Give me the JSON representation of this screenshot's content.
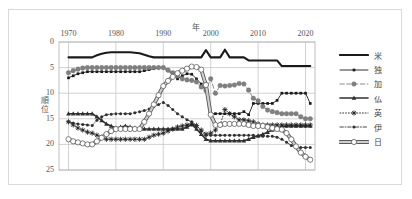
{
  "chart_data": {
    "type": "line",
    "title": "",
    "xlabel": "年",
    "ylabel": "順位",
    "xlim": [
      1968,
      2022
    ],
    "ylim": [
      0,
      25
    ],
    "y_inverted": true,
    "grid": true,
    "legend_position": "right",
    "xticks": [
      "1970",
      "1980",
      "1990",
      "2000",
      "2010",
      "2020"
    ],
    "xtick_values": [
      1970,
      1980,
      1990,
      2000,
      2010,
      2020
    ],
    "yticks": [
      "0",
      "5",
      "10",
      "15",
      "20",
      "25"
    ],
    "ytick_values": [
      0,
      5,
      10,
      15,
      20,
      25
    ],
    "x": [
      1970,
      1971,
      1972,
      1973,
      1974,
      1975,
      1976,
      1977,
      1978,
      1979,
      1980,
      1981,
      1982,
      1983,
      1984,
      1985,
      1986,
      1987,
      1988,
      1989,
      1990,
      1991,
      1992,
      1993,
      1994,
      1995,
      1996,
      1997,
      1998,
      1999,
      2000,
      2001,
      2002,
      2003,
      2004,
      2005,
      2006,
      2007,
      2008,
      2009,
      2010,
      2011,
      2012,
      2013,
      2014,
      2015,
      2016,
      2017,
      2018,
      2019,
      2020,
      2021
    ],
    "series": [
      {
        "name": "米",
        "marker": "none",
        "line": "solid",
        "width": 2.1,
        "color": "#1a1a1a",
        "values": [
          3,
          3,
          3,
          3,
          3,
          3,
          2.6,
          2.3,
          2.1,
          2,
          2,
          2,
          2,
          2,
          2.1,
          2.2,
          2.5,
          2.8,
          3,
          3,
          3,
          3,
          3,
          3,
          3,
          3,
          3,
          3,
          3,
          1.6,
          3,
          3,
          3,
          1.5,
          3,
          3,
          3,
          3,
          3.6,
          3.6,
          3.6,
          3.6,
          3.6,
          3.6,
          3.6,
          4.7,
          4.7,
          4.7,
          4.7,
          4.7,
          4.7,
          4.7
        ]
      },
      {
        "name": "独",
        "marker": "square-small",
        "line": "solid",
        "width": 0.9,
        "color": "#1a1a1a",
        "values": [
          7,
          6.6,
          6.2,
          6,
          5.8,
          5.8,
          5.8,
          5.8,
          5.8,
          5.8,
          5.8,
          5.8,
          5.8,
          5.8,
          5.8,
          5.8,
          5.6,
          5.4,
          5.2,
          5,
          5,
          5.6,
          6.4,
          7.2,
          6.6,
          6.2,
          6.3,
          7.2,
          8.2,
          9.6,
          14,
          14,
          14,
          14,
          14,
          14,
          14,
          13.6,
          14.2,
          12,
          12,
          12,
          12,
          12,
          11.4,
          10,
          10,
          10,
          10,
          10,
          10,
          12
        ]
      },
      {
        "name": "加",
        "marker": "circle-filled",
        "line": "dashed",
        "width": 0.9,
        "color": "#808080",
        "values": [
          6,
          5.6,
          5.3,
          5.1,
          5,
          5,
          5,
          5,
          5,
          5,
          5,
          5,
          5,
          5,
          5,
          5,
          5,
          5,
          5,
          5,
          5,
          5.5,
          6,
          6.6,
          7.2,
          7.4,
          7.5,
          7.8,
          8.8,
          9.4,
          7.2,
          10,
          8.5,
          8.6,
          8.5,
          8.4,
          8.1,
          8.2,
          9.4,
          11,
          11.5,
          12.6,
          13.3,
          13.6,
          13.8,
          14,
          14,
          14,
          14,
          14.6,
          15,
          15
        ]
      },
      {
        "name": "仏",
        "marker": "triangle-filled",
        "line": "solid",
        "width": 1.6,
        "color": "#303030",
        "values": [
          14,
          14,
          14,
          14,
          14,
          14,
          14.6,
          15.3,
          16,
          16.4,
          16.8,
          16.6,
          16.4,
          16.6,
          16.8,
          17,
          17,
          17,
          17,
          17,
          17,
          17,
          17,
          17,
          17,
          16.6,
          16.1,
          17,
          18,
          19,
          19.3,
          19.3,
          19.3,
          19.3,
          19.3,
          19.3,
          19.3,
          19.3,
          19,
          18.6,
          18.3,
          18,
          17.6,
          17.2,
          16.8,
          16.5,
          16.4,
          16.4,
          16.4,
          16.4,
          16.4,
          16.4
        ]
      },
      {
        "name": "英",
        "marker": "star",
        "line": "dotted",
        "width": 0.9,
        "color": "#202020",
        "values": [
          15.6,
          16.2,
          16.8,
          17.2,
          17.6,
          17.8,
          18.2,
          18.6,
          19,
          19,
          19,
          19,
          19,
          19,
          19,
          19,
          19,
          18.6,
          18.2,
          18,
          17.8,
          17.4,
          17,
          16.6,
          16.4,
          16.2,
          16,
          16.3,
          17.2,
          18,
          17.8,
          17.2,
          16.2,
          13.2,
          14,
          14.6,
          15.2,
          15.2,
          15.4,
          15.6,
          16,
          16.2,
          16.2,
          16.2,
          16.2,
          16.2,
          16.2,
          16.2,
          16.2,
          16.2,
          16.2,
          16.2
        ]
      },
      {
        "name": "伊",
        "marker": "circle-small",
        "line": "dashdot",
        "width": 0.9,
        "color": "#303030",
        "values": [
          15.6,
          15.8,
          16,
          16.1,
          16.2,
          16.3,
          15.3,
          14.6,
          14.2,
          14.1,
          14,
          14,
          14,
          14,
          13.8,
          13.6,
          13.4,
          13.1,
          12.6,
          12.2,
          11.8,
          12.4,
          13.2,
          14,
          14.6,
          15.2,
          15.6,
          16.4,
          17.4,
          18.2,
          18.2,
          18.2,
          18.2,
          18.2,
          18.2,
          18.2,
          18.2,
          18.2,
          18.2,
          18.2,
          18.4,
          18.4,
          18.4,
          18.4,
          18.6,
          19,
          19.6,
          20.2,
          20.6,
          20.6,
          20.6,
          20.6
        ]
      },
      {
        "name": "日",
        "marker": "circle-open",
        "line": "solid",
        "width": 3.0,
        "color": "#9a9a9a",
        "values": [
          19,
          19.4,
          19.6,
          19.8,
          20,
          20,
          19.4,
          18.7,
          18,
          17.4,
          17,
          17,
          17,
          17,
          17,
          17,
          15.6,
          14,
          12.2,
          10.4,
          8.6,
          7.6,
          6.8,
          6.1,
          5.6,
          5.2,
          4.8,
          4.9,
          5.4,
          8.4,
          14.2,
          16.2,
          16.2,
          16,
          16,
          16,
          16,
          16,
          16.2,
          16.4,
          16.4,
          16.4,
          16.6,
          16.8,
          17,
          17.1,
          17.8,
          19,
          20.4,
          21.6,
          22.4,
          23
        ]
      }
    ]
  }
}
